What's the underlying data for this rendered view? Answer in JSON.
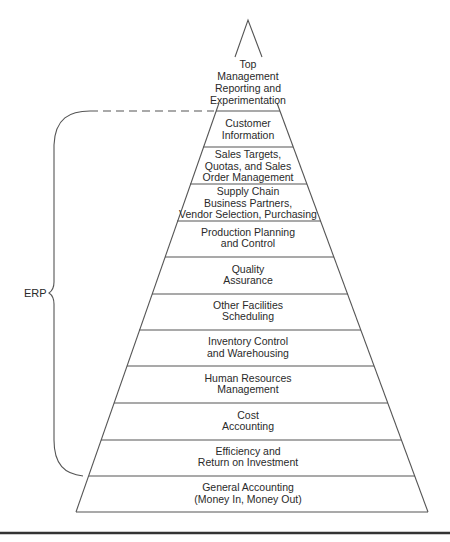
{
  "diagram": {
    "apex": {
      "lines": [
        "Top",
        "Management",
        "Reporting and",
        "Experimentation"
      ]
    },
    "brace_label": "ERP",
    "layers": [
      {
        "lines": [
          "Customer",
          "Information"
        ]
      },
      {
        "lines": [
          "Sales Targets,",
          "Quotas, and Sales",
          "Order Management"
        ]
      },
      {
        "lines": [
          "Supply Chain",
          "Business Partners,",
          "Vendor Selection, Purchasing"
        ]
      },
      {
        "lines": [
          "Production Planning",
          "and Control"
        ]
      },
      {
        "lines": [
          "Quality",
          "Assurance"
        ]
      },
      {
        "lines": [
          "Other Facilities",
          "Scheduling"
        ]
      },
      {
        "lines": [
          "Inventory Control",
          "and Warehousing"
        ]
      },
      {
        "lines": [
          "Human Resources",
          "Management"
        ]
      },
      {
        "lines": [
          "Cost",
          "Accounting"
        ]
      },
      {
        "lines": [
          "Efficiency and",
          "Return on Investment"
        ]
      },
      {
        "lines": [
          "General Accounting",
          "(Money In, Money Out)"
        ]
      }
    ]
  }
}
